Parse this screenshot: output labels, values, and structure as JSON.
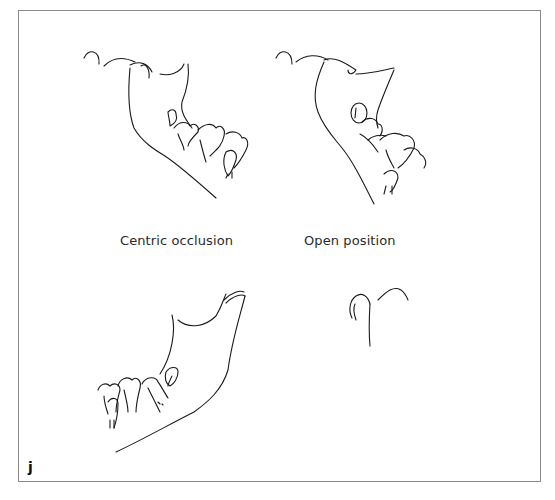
{
  "figure": {
    "panel_letter": "j",
    "frame_color": "#8a8a8a",
    "line_color": "#1a1a1a",
    "drawings": [
      {
        "id": "centric-occlusion-lateral",
        "description": "Lateral view of mandible and teeth in centric occlusion"
      },
      {
        "id": "open-position-lateral",
        "description": "Lateral view of mandible and teeth in open position"
      },
      {
        "id": "mandible-lower-left",
        "description": "Mandible outline with lower molars"
      },
      {
        "id": "condyle-fossa-lower-right",
        "description": "Condyle and articular eminence outline"
      }
    ],
    "labels": {
      "centric": "Centric occlusion",
      "open": "Open position"
    }
  }
}
